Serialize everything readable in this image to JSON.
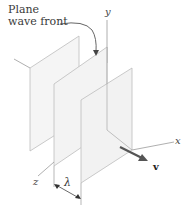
{
  "diagram": {
    "title_lines": [
      "Plane",
      "wave front"
    ],
    "axes": {
      "x": "x",
      "y": "y",
      "z": "z"
    },
    "wavelength_label": "λ",
    "velocity_label": "v",
    "icons": {
      "wave_front_pointer": "curved-arrow-icon",
      "velocity_arrow": "arrow-right-down-icon",
      "wavelength_dimension": "double-arrow-icon"
    },
    "colors": {
      "plane_fill": "#f4f4f4",
      "plane_edge": "#bdbdbd",
      "axis": "#9a9a9a",
      "arrow": "#555555",
      "text": "#333333"
    },
    "plane_count": 3
  }
}
